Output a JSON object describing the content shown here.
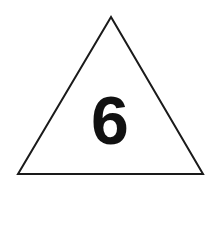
{
  "sign": {
    "shape": "triangle",
    "number": "6",
    "stroke_color": "#1a1a1a",
    "fill_color": "#ffffff",
    "text_color": "#111111"
  }
}
